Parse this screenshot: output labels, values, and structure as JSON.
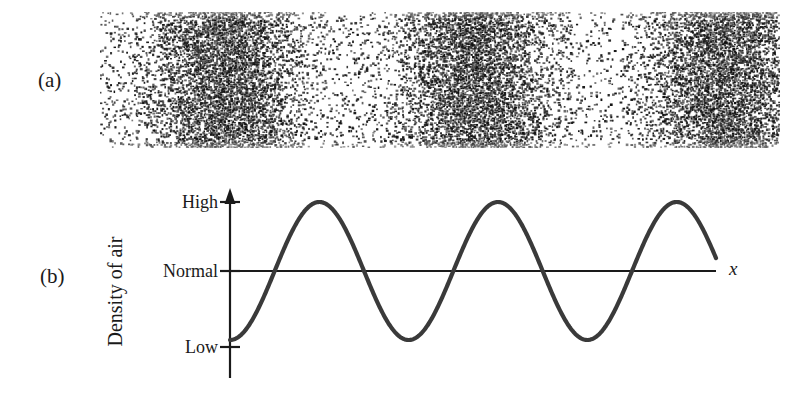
{
  "figure": {
    "panels": [
      {
        "id": "a",
        "label": "(a)",
        "description": "Dot-density representation of air molecules showing compressions and rarefactions of a sound wave"
      },
      {
        "id": "b",
        "label": "(b)",
        "description": "Graph of air density versus position for the same sound wave"
      }
    ]
  },
  "plot": {
    "y_axis_title": "Density of air",
    "x_axis_label": "x",
    "tick_labels": {
      "high": "High",
      "normal": "Normal",
      "low": "Low"
    }
  },
  "chart_data": {
    "type": "line",
    "title": "",
    "xlabel": "x",
    "ylabel": "Density of air",
    "grid": false,
    "legend": false,
    "ytick_labels": [
      "High",
      "Normal",
      "Low"
    ],
    "ytick_values": [
      1,
      0,
      -1
    ],
    "ylim": [
      -1.35,
      1.35
    ],
    "xlim": [
      0,
      2.72
    ],
    "xtick_labels": [],
    "waveform": {
      "function": "-cos",
      "amplitude": 1,
      "period": 1,
      "phase_deg": 180,
      "cycles": 2.72,
      "baseline": 0
    },
    "annotations": {
      "wave_start_value": "Low",
      "peaks_at_cycles": [
        0.5,
        1.5
      ],
      "troughs_at_cycles": [
        1.0,
        2.0
      ],
      "zero_crossings_at_cycles": [
        0.25,
        0.75,
        1.25,
        1.75,
        2.25
      ]
    },
    "series": [
      {
        "name": "Air density",
        "color": "#3a3a3a",
        "x": [
          0.0,
          0.1,
          0.2,
          0.25,
          0.3,
          0.4,
          0.5,
          0.6,
          0.7,
          0.75,
          0.8,
          0.9,
          1.0,
          1.1,
          1.2,
          1.25,
          1.3,
          1.4,
          1.5,
          1.6,
          1.7,
          1.75,
          1.8,
          1.9,
          2.0,
          2.1,
          2.2,
          2.25,
          2.3,
          2.4,
          2.5,
          2.6,
          2.72
        ],
        "y": [
          -1.0,
          -0.809,
          -0.309,
          0.0,
          0.309,
          0.809,
          1.0,
          0.809,
          0.309,
          0.0,
          -0.309,
          -0.809,
          -1.0,
          -0.809,
          -0.309,
          0.0,
          0.309,
          0.809,
          1.0,
          0.809,
          0.309,
          0.0,
          -0.309,
          -0.809,
          -1.0,
          -0.809,
          -0.309,
          0.0,
          0.309,
          0.809,
          1.0,
          0.809,
          0.0
        ]
      }
    ]
  },
  "density_field": {
    "type": "dot-density",
    "cycles": 2.72,
    "compression_label": "compression",
    "rarefaction_label": "rarefaction",
    "dot_color": "#111111",
    "background_color": "#ffffff"
  },
  "colors": {
    "ink": "#1a1a1a",
    "curve": "#3a3a3a",
    "axis": "#1a1a1a",
    "background": "#ffffff"
  }
}
